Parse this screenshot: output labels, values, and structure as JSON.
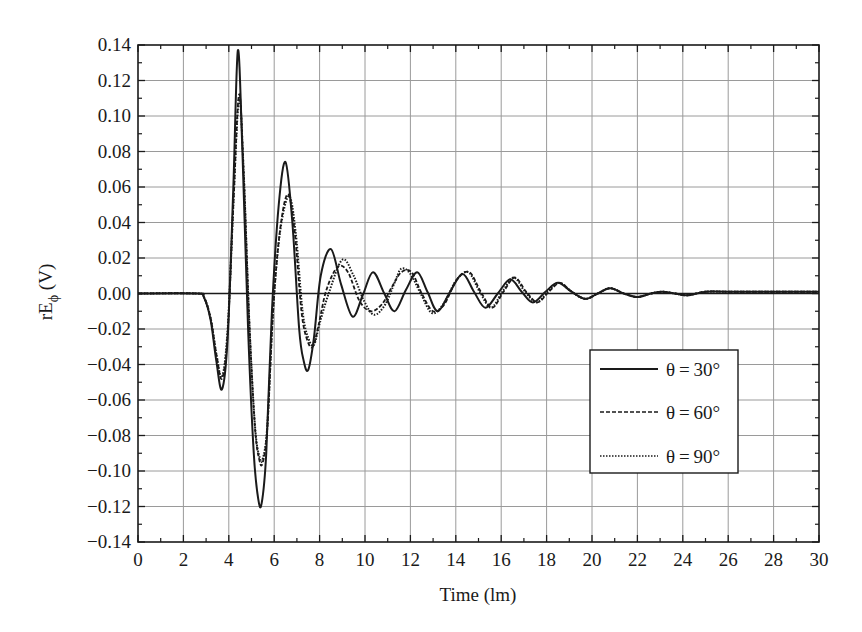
{
  "chart_data": {
    "type": "line",
    "title": "",
    "xlabel": "Time (lm)",
    "ylabel": "rEφ (V)",
    "ylabel_main": "rE",
    "ylabel_sub": "ϕ",
    "ylabel_unit": " (V)",
    "xlim": [
      0,
      30
    ],
    "ylim": [
      -0.14,
      0.14
    ],
    "grid": true,
    "legend_position": "right-lower-middle",
    "x_ticks": [
      0,
      2,
      4,
      6,
      8,
      10,
      12,
      14,
      16,
      18,
      20,
      22,
      24,
      26,
      28,
      30
    ],
    "x_tick_labels": [
      "0",
      "2",
      "4",
      "6",
      "8",
      "10",
      "12",
      "14",
      "16",
      "18",
      "20",
      "22",
      "24",
      "26",
      "28",
      "30"
    ],
    "y_ticks": [
      0.14,
      0.12,
      0.1,
      0.08,
      0.06,
      0.04,
      0.02,
      0.0,
      -0.02,
      -0.04,
      -0.06,
      -0.08,
      -0.1,
      -0.12,
      -0.14
    ],
    "y_tick_labels": [
      "0.14",
      "0.12",
      "0.10",
      "0.08",
      "0.06",
      "0.04",
      "0.02",
      "0.00",
      "−0.02",
      "−0.04",
      "−0.06",
      "−0.08",
      "−0.10",
      "−0.12",
      "−0.14"
    ],
    "series": [
      {
        "name": "θ = 30°",
        "label": "θ = 30°",
        "style": "solid",
        "x": [
          0,
          2.6,
          2.9,
          3.2,
          3.45,
          3.7,
          3.95,
          4.2,
          4.4,
          4.6,
          4.85,
          5.1,
          5.3,
          5.45,
          5.65,
          5.9,
          6.2,
          6.5,
          6.8,
          7.1,
          7.3,
          7.5,
          7.75,
          8.05,
          8.5,
          8.95,
          9.45,
          9.9,
          10.35,
          10.85,
          11.3,
          11.8,
          12.3,
          12.75,
          13.2,
          13.75,
          14.3,
          14.8,
          15.3,
          15.85,
          16.4,
          16.9,
          17.4,
          17.95,
          18.5,
          19.1,
          19.7,
          20.25,
          20.8,
          21.4,
          22.0,
          22.6,
          23.1,
          23.65,
          24.2,
          25.0,
          26.0,
          28.0,
          30.0
        ],
        "y": [
          0,
          0,
          -0.002,
          -0.015,
          -0.038,
          -0.054,
          -0.025,
          0.06,
          0.137,
          0.08,
          -0.02,
          -0.09,
          -0.116,
          -0.118,
          -0.09,
          -0.01,
          0.05,
          0.074,
          0.04,
          -0.02,
          -0.038,
          -0.043,
          -0.025,
          0.01,
          0.025,
          0.005,
          -0.013,
          -0.001,
          0.012,
          0.0,
          -0.01,
          0.002,
          0.012,
          0.001,
          -0.01,
          0.001,
          0.011,
          0.001,
          -0.008,
          0.0,
          0.008,
          0.001,
          -0.005,
          0.001,
          0.006,
          0.001,
          -0.003,
          0.0,
          0.003,
          0.0,
          -0.002,
          0.0,
          0.001,
          0.0,
          -0.001,
          0.001,
          0.001,
          0.001,
          0.001
        ]
      },
      {
        "name": "θ = 60°",
        "label": "θ = 60°",
        "style": "dashed",
        "x": [
          0,
          2.6,
          2.9,
          3.2,
          3.45,
          3.7,
          3.95,
          4.2,
          4.45,
          4.65,
          4.9,
          5.15,
          5.35,
          5.5,
          5.7,
          5.95,
          6.25,
          6.6,
          6.9,
          7.2,
          7.45,
          7.7,
          7.95,
          8.3,
          8.8,
          9.25,
          9.75,
          10.25,
          10.75,
          11.2,
          11.6,
          12.05,
          12.5,
          13.0,
          13.5,
          14.05,
          14.6,
          15.1,
          15.6,
          16.1,
          16.6,
          17.1,
          17.6,
          18.1,
          18.6,
          19.1,
          19.7,
          20.25,
          20.8,
          21.4,
          22.0,
          22.6,
          23.1,
          23.65,
          24.2,
          25.0,
          26.0,
          28.0,
          30.0
        ],
        "y": [
          0,
          0,
          -0.002,
          -0.014,
          -0.034,
          -0.048,
          -0.022,
          0.05,
          0.112,
          0.07,
          -0.015,
          -0.075,
          -0.094,
          -0.095,
          -0.075,
          -0.01,
          0.035,
          0.056,
          0.035,
          -0.01,
          -0.026,
          -0.03,
          -0.018,
          0.002,
          0.015,
          0.012,
          -0.004,
          -0.01,
          -0.006,
          0.004,
          0.012,
          0.012,
          0.0,
          -0.01,
          -0.006,
          0.008,
          0.012,
          0.001,
          -0.008,
          0.001,
          0.009,
          0.001,
          -0.005,
          0.001,
          0.006,
          0.001,
          -0.003,
          0.0,
          0.003,
          0.0,
          -0.002,
          0.0,
          0.001,
          0.0,
          -0.001,
          0.001,
          0.001,
          0.001,
          0.001
        ]
      },
      {
        "name": "θ = 90°",
        "label": "θ = 90°",
        "style": "dotted",
        "x": [
          0,
          2.6,
          2.9,
          3.2,
          3.45,
          3.7,
          3.95,
          4.2,
          4.45,
          4.65,
          4.9,
          5.15,
          5.35,
          5.5,
          5.7,
          5.95,
          6.25,
          6.65,
          6.95,
          7.25,
          7.5,
          7.75,
          8.0,
          8.4,
          9.0,
          9.5,
          9.95,
          10.4,
          10.9,
          11.3,
          11.6,
          12.0,
          12.45,
          12.95,
          13.45,
          14.0,
          14.55,
          15.05,
          15.55,
          16.05,
          16.55,
          17.05,
          17.55,
          18.05,
          18.55,
          19.1,
          19.7,
          20.25,
          20.8,
          21.4,
          22.0,
          22.6,
          23.1,
          23.65,
          24.2,
          25.0,
          26.0,
          28.0,
          30.0
        ],
        "y": [
          0,
          0,
          -0.002,
          -0.014,
          -0.034,
          -0.047,
          -0.02,
          0.05,
          0.11,
          0.07,
          -0.015,
          -0.074,
          -0.092,
          -0.093,
          -0.074,
          -0.01,
          0.034,
          0.055,
          0.034,
          -0.01,
          -0.025,
          -0.029,
          -0.017,
          0.0,
          0.019,
          0.01,
          -0.004,
          -0.012,
          -0.006,
          0.006,
          0.014,
          0.011,
          0.0,
          -0.011,
          -0.006,
          0.007,
          0.012,
          0.001,
          -0.008,
          0.001,
          0.009,
          0.001,
          -0.005,
          0.001,
          0.006,
          0.001,
          -0.003,
          0.0,
          0.003,
          0.0,
          -0.002,
          0.0,
          0.001,
          0.0,
          -0.001,
          0.001,
          0.001,
          0.001,
          0.001
        ]
      }
    ]
  },
  "legend": {
    "items": [
      {
        "label": "θ = 30°",
        "style": "solid"
      },
      {
        "label": "θ = 60°",
        "style": "dashed"
      },
      {
        "label": "θ = 90°",
        "style": "dotted"
      }
    ]
  },
  "colors": {
    "line": "#1a1a1a",
    "grid": "#9a9a9a",
    "axis": "#1a1a1a",
    "background": "#ffffff"
  }
}
